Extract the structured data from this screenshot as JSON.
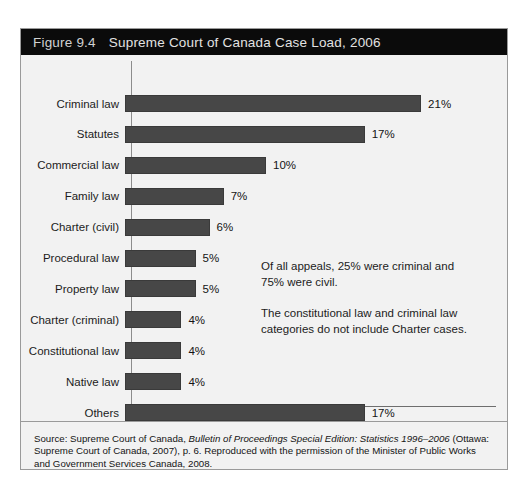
{
  "figure": {
    "number": "Figure 9.4",
    "title": "Supreme Court of Canada Case Load, 2006"
  },
  "annotations": [
    "Of all appeals, 25% were criminal and 75% were civil.",
    "The constitutional law and criminal law categories do not include Charter cases."
  ],
  "source": {
    "prefix": "Source: Supreme Court of Canada, ",
    "italic": "Bulletin of Proceedings Special Edition: Statistics 1996–2006",
    "suffix": " (Ottawa: Supreme Court of Canada, 2007), p. 6. Reproduced with the permission of the Minister of Public Works and Government Services Canada, 2008."
  },
  "colors": {
    "bar_fill": "#474747",
    "header_background": "#0b0b0b",
    "panel_background": "#f2f2f2",
    "axis": "#8c8c8c"
  },
  "chart_data": {
    "type": "bar",
    "orientation": "horizontal",
    "title": "Supreme Court of Canada Case Load, 2006",
    "xlabel": "",
    "ylabel": "",
    "xlim": [
      0,
      24
    ],
    "grid": false,
    "legend": false,
    "value_suffix": "%",
    "categories": [
      "Criminal law",
      "Statutes",
      "Commercial law",
      "Family law",
      "Charter (civil)",
      "Procedural law",
      "Property law",
      "Charter (criminal)",
      "Constitutional law",
      "Native law",
      "Others"
    ],
    "values": [
      21,
      17,
      10,
      7,
      6,
      5,
      5,
      4,
      4,
      4,
      17
    ],
    "labels": [
      "21%",
      "17%",
      "10%",
      "7%",
      "6%",
      "5%",
      "5%",
      "4%",
      "4%",
      "4%",
      "17%"
    ]
  }
}
